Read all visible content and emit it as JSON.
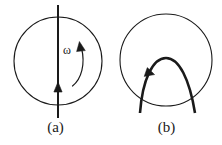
{
  "figure": {
    "background_color": "#ffffff",
    "stroke_color": "#1a1a1a",
    "panels": [
      {
        "id": "a",
        "caption": "(a)",
        "circle": {
          "center_x": 58,
          "center_y": 61,
          "radius": 44,
          "stroke_width": 1.1
        },
        "axis_arrow": {
          "name": "rotation-axis-arrow",
          "x": 58,
          "y_top": 5,
          "y_bottom": 118,
          "stroke_width": 2,
          "arrowhead_y": 88,
          "arrowhead_direction": "up"
        },
        "omega_arrow": {
          "name": "angular-velocity-arrow",
          "label": "ω",
          "direction": "counterclockwise",
          "arrowhead_at": "top",
          "stroke_width": 1.2
        }
      },
      {
        "id": "b",
        "caption": "(b)",
        "circle": {
          "center_x": 55,
          "center_y": 60,
          "radius": 46,
          "stroke_width": 1.1
        },
        "parabola": {
          "name": "trajectory-arc",
          "apex_x": 55,
          "apex_y": 58,
          "left_end_x": 29,
          "right_end_x": 84,
          "end_y": 113,
          "stroke_width": 2.6,
          "arrowhead_direction": "up-right",
          "arrowhead_x": 38,
          "arrowhead_y": 73
        }
      }
    ]
  }
}
